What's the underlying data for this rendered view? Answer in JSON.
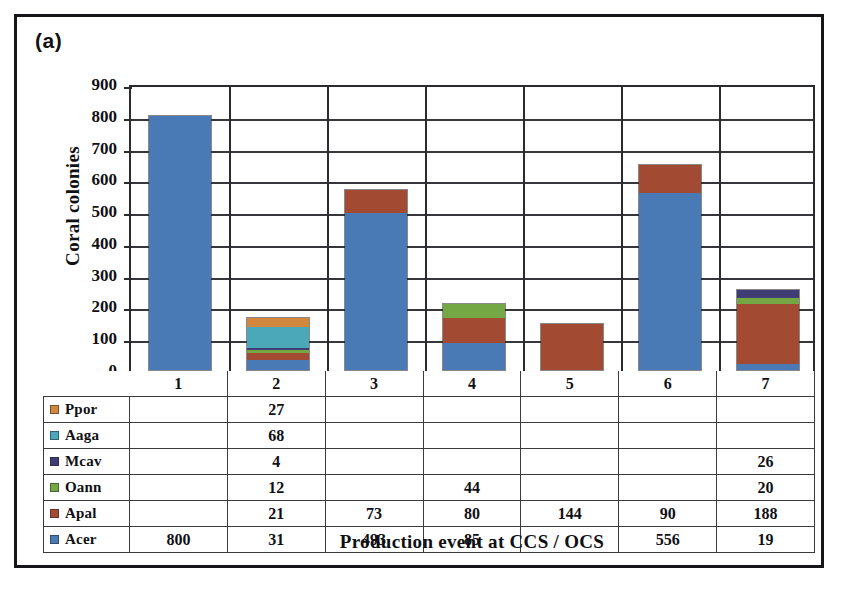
{
  "figure": {
    "panel_label": "(a)"
  },
  "chart_data": {
    "type": "bar",
    "stacked": true,
    "title": "",
    "xlabel": "Production event at CCS / OCS",
    "ylabel": "Coral colonies",
    "categories": [
      "1",
      "2",
      "3",
      "4",
      "5",
      "6",
      "7"
    ],
    "ylim": [
      0,
      900
    ],
    "yticks": [
      0,
      100,
      200,
      300,
      400,
      500,
      600,
      700,
      800,
      900
    ],
    "grid": true,
    "legend_position": "table-left",
    "series": [
      {
        "name": "Ppor",
        "color": "#d2873c",
        "values": [
          null,
          27,
          null,
          null,
          null,
          null,
          null
        ]
      },
      {
        "name": "Aaga",
        "color": "#4ba8b8",
        "values": [
          null,
          68,
          null,
          null,
          null,
          null,
          null
        ]
      },
      {
        "name": "Mcav",
        "color": "#403c74",
        "values": [
          null,
          4,
          null,
          null,
          null,
          null,
          26
        ]
      },
      {
        "name": "Oann",
        "color": "#74a845",
        "values": [
          null,
          12,
          null,
          44,
          null,
          null,
          20
        ]
      },
      {
        "name": "Apal",
        "color": "#a34a32",
        "values": [
          null,
          21,
          73,
          80,
          144,
          90,
          188
        ]
      },
      {
        "name": "Acer",
        "color": "#4a7ab5",
        "values": [
          800,
          31,
          493,
          85,
          null,
          556,
          19
        ]
      }
    ],
    "stack_order_bottom_to_top": [
      "Acer",
      "Apal",
      "Oann",
      "Mcav",
      "Aaga",
      "Ppor"
    ],
    "column_totals": [
      800,
      163,
      566,
      209,
      144,
      646,
      253
    ]
  },
  "table": {
    "header": [
      "",
      "1",
      "2",
      "3",
      "4",
      "5",
      "6",
      "7"
    ],
    "rows": [
      {
        "label": "Ppor",
        "color": "#d2873c",
        "cells": [
          "",
          "27",
          "",
          "",
          "",
          "",
          ""
        ]
      },
      {
        "label": "Aaga",
        "color": "#4ba8b8",
        "cells": [
          "",
          "68",
          "",
          "",
          "",
          "",
          ""
        ]
      },
      {
        "label": "Mcav",
        "color": "#403c74",
        "cells": [
          "",
          "4",
          "",
          "",
          "",
          "",
          "26"
        ]
      },
      {
        "label": "Oann",
        "color": "#74a845",
        "cells": [
          "",
          "12",
          "",
          "44",
          "",
          "",
          "20"
        ]
      },
      {
        "label": "Apal",
        "color": "#a34a32",
        "cells": [
          "",
          "21",
          "73",
          "80",
          "144",
          "90",
          "188"
        ]
      },
      {
        "label": "Acer",
        "color": "#4a7ab5",
        "cells": [
          "800",
          "31",
          "493",
          "85",
          "",
          "556",
          "19"
        ]
      }
    ]
  }
}
